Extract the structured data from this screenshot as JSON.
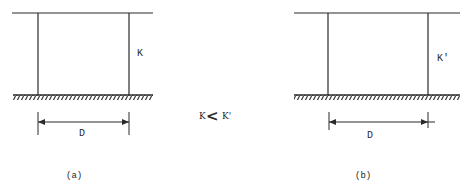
{
  "colors": {
    "line": "#2a2a2a",
    "background": "#ffffff"
  },
  "frame_a": {
    "stiffness_label": "K",
    "dimension_label": "D",
    "caption": "(a)"
  },
  "frame_b": {
    "stiffness_label": "K'",
    "dimension_label": "D",
    "caption": "(b)"
  },
  "comparison": {
    "left": "K",
    "operator": "<",
    "right": "K'"
  }
}
